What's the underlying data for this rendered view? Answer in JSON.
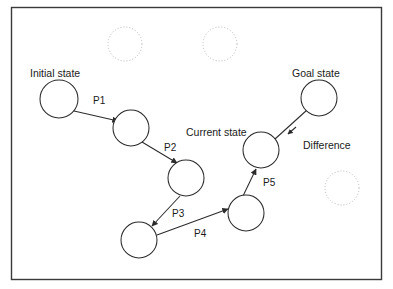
{
  "figure": {
    "background_color": "#ffffff",
    "frame": {
      "x": 11,
      "y": 7,
      "width": 371,
      "height": 273,
      "stroke_color": "#3a3a3a"
    }
  },
  "labels": {
    "initial_state": "Initial state",
    "goal_state": "Goal state",
    "current_state": "Current state",
    "difference": "Difference"
  },
  "operators": [
    {
      "name": "P1",
      "label": "P1",
      "x": 93,
      "y": 104
    },
    {
      "name": "P2",
      "label": "P2",
      "x": 164,
      "y": 151
    },
    {
      "name": "P3",
      "label": "P3",
      "x": 172,
      "y": 217
    },
    {
      "name": "P4",
      "label": "P4",
      "x": 194,
      "y": 237
    },
    {
      "name": "P5",
      "label": "P5",
      "x": 263,
      "y": 186
    }
  ],
  "state_nodes": [
    {
      "name": "initial-state",
      "cx": 59,
      "cy": 99,
      "r": 19
    },
    {
      "name": "state-2",
      "cx": 131,
      "cy": 128,
      "r": 18
    },
    {
      "name": "state-3",
      "cx": 186,
      "cy": 178,
      "r": 18
    },
    {
      "name": "state-4",
      "cx": 139,
      "cy": 240,
      "r": 18
    },
    {
      "name": "state-5",
      "cx": 246,
      "cy": 213,
      "r": 18
    },
    {
      "name": "current-state",
      "cx": 261,
      "cy": 150,
      "r": 18
    },
    {
      "name": "goal-state",
      "cx": 319,
      "cy": 98,
      "r": 18
    }
  ],
  "ghost_nodes": [
    {
      "name": "unexplored-state-1",
      "cx": 125,
      "cy": 44,
      "r": 17
    },
    {
      "name": "unexplored-state-2",
      "cx": 220,
      "cy": 44,
      "r": 17
    },
    {
      "name": "unexplored-state-3",
      "cx": 342,
      "cy": 188,
      "r": 17
    }
  ],
  "text_positions": {
    "initial_state": {
      "x": 30,
      "y": 77
    },
    "goal_state": {
      "x": 292,
      "y": 77
    },
    "current_state": {
      "x": 186,
      "y": 136
    },
    "difference": {
      "x": 303,
      "y": 149
    }
  },
  "colors": {
    "stroke": "#2b2b2b",
    "ghost_stroke": "#b9b9c4",
    "text": "#1a1a1a",
    "frame": "#3a3a3a",
    "background": "#ffffff"
  }
}
